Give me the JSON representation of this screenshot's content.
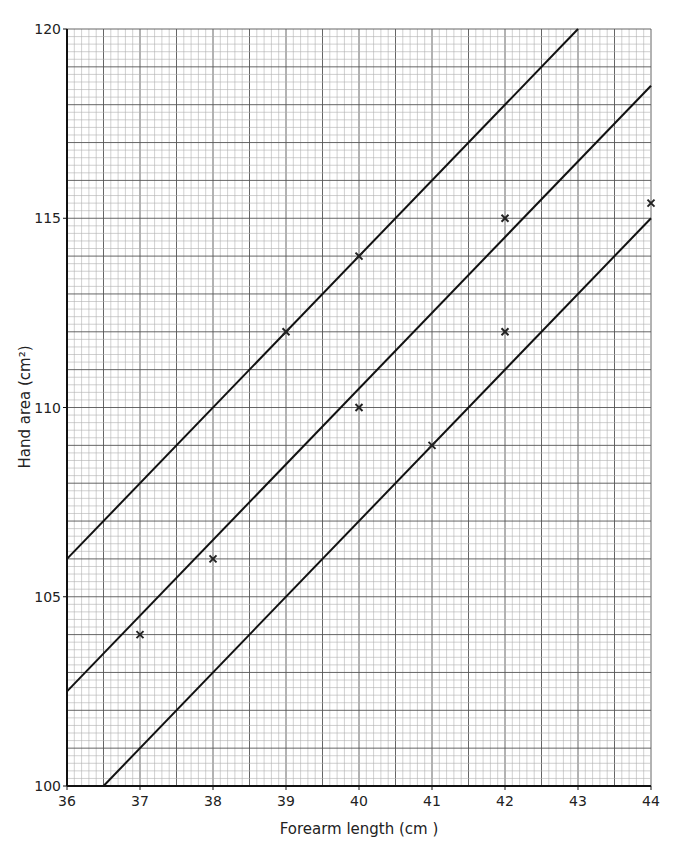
{
  "chart_data": {
    "type": "scatter",
    "title": "",
    "xlabel": "Forearm length (cm )",
    "ylabel": "Hand area (cm²)",
    "xlim": [
      36,
      44
    ],
    "ylim": [
      100,
      120
    ],
    "x_ticks": [
      36,
      37,
      38,
      39,
      40,
      41,
      42,
      43,
      44
    ],
    "y_ticks": [
      100,
      105,
      110,
      115,
      120
    ],
    "grid": true,
    "grid_minor_x_step": 0.1,
    "grid_minor_y_step": 0.2,
    "points": [
      {
        "x": 37,
        "y": 104
      },
      {
        "x": 38,
        "y": 106
      },
      {
        "x": 39,
        "y": 112
      },
      {
        "x": 40,
        "y": 114
      },
      {
        "x": 40,
        "y": 110
      },
      {
        "x": 41,
        "y": 109
      },
      {
        "x": 42,
        "y": 115
      },
      {
        "x": 42,
        "y": 112
      },
      {
        "x": 44,
        "y": 115.4
      }
    ],
    "lines": [
      {
        "name": "upper",
        "x1": 36,
        "y1": 106,
        "x2": 43,
        "y2": 120
      },
      {
        "name": "middle",
        "x1": 36,
        "y1": 102.5,
        "x2": 44,
        "y2": 118.5
      },
      {
        "name": "lower",
        "x1": 36.5,
        "y1": 100,
        "x2": 44,
        "y2": 115
      }
    ],
    "marker": "x",
    "colors": {
      "grid_minor": "#b0b0b0",
      "grid_major": "#555555",
      "line": "#111111",
      "marker": "#222222"
    }
  }
}
